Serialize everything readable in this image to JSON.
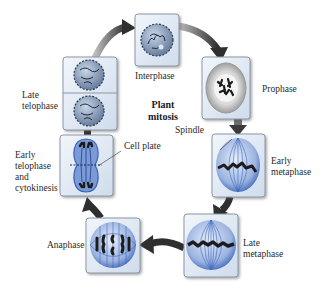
{
  "diagram": {
    "title": "Plant\nmitosis",
    "stages": [
      {
        "id": "interphase",
        "label": "Interphase"
      },
      {
        "id": "prophase",
        "label": "Prophase"
      },
      {
        "id": "early-metaphase",
        "label": "Early\nmetaphase"
      },
      {
        "id": "late-metaphase",
        "label": "Late\nmetaphase"
      },
      {
        "id": "anaphase",
        "label": "Anaphase"
      },
      {
        "id": "early-telophase",
        "label": "Early\ntelophase\nand\ncytokinesis"
      },
      {
        "id": "late-telophase",
        "label": "Late\ntelophase"
      }
    ],
    "callouts": {
      "spindle": "Spindle",
      "cell_plate": "Cell plate"
    },
    "colors": {
      "box_fill": "#dfe8f3",
      "box_border": "#8a97a8",
      "spindle_blue": "#3a63b8",
      "chromosome": "#1c1c1c",
      "arrow": "#3a3a3a",
      "nucleus": "#6f86a8"
    }
  }
}
